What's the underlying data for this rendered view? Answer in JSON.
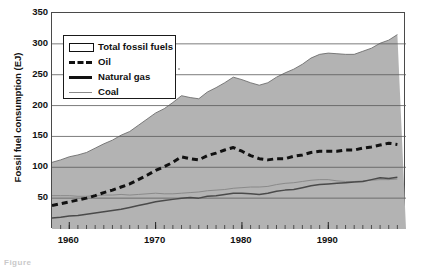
{
  "figure": {
    "caption_remnant": "Figure",
    "y_axis_title": "Fossil fuel consumption (EJ)"
  },
  "legend": {
    "items": [
      {
        "label": "Total fossil fuels",
        "key": "area-swatch-icon",
        "color": "#b3b3b3"
      },
      {
        "label": "Oil",
        "key": "dashed-line-icon",
        "color": "#111111"
      },
      {
        "label": "Natural gas",
        "key": "solid-thick-line-icon",
        "color": "#111111"
      },
      {
        "label": "Coal",
        "key": "thin-line-icon",
        "color": "#8a8a8a"
      }
    ]
  },
  "chart_data": {
    "type": "line",
    "title": "",
    "subtitle": "",
    "xlabel": "",
    "ylabel": "Fossil fuel consumption (EJ)",
    "xlim": [
      1958,
      1999
    ],
    "ylim": [
      0,
      350
    ],
    "yticks": [
      0,
      50,
      100,
      150,
      200,
      250,
      300,
      350
    ],
    "ytick_labels": [
      "",
      "50",
      "100",
      "150",
      "200",
      "250",
      "300",
      "350"
    ],
    "xticks": [
      1960,
      1970,
      1980,
      1990
    ],
    "xtick_labels": [
      "1960",
      "1970",
      "1980",
      "1990"
    ],
    "minor_xtick_interval": 1,
    "grid": "horizontal-only",
    "legend_position": "upper-left-inside",
    "x": [
      1958,
      1959,
      1960,
      1961,
      1962,
      1963,
      1964,
      1965,
      1966,
      1967,
      1968,
      1969,
      1970,
      1971,
      1972,
      1973,
      1974,
      1975,
      1976,
      1977,
      1978,
      1979,
      1980,
      1981,
      1982,
      1983,
      1984,
      1985,
      1986,
      1987,
      1988,
      1989,
      1990,
      1991,
      1992,
      1993,
      1994,
      1995,
      1996,
      1997,
      1998
    ],
    "series": [
      {
        "name": "Total fossil fuels",
        "style": "filled-area",
        "fill": "#b3b3b3",
        "values": [
          108,
          112,
          117,
          120,
          124,
          131,
          138,
          144,
          152,
          158,
          168,
          178,
          188,
          195,
          205,
          216,
          213,
          211,
          222,
          229,
          237,
          246,
          242,
          237,
          233,
          237,
          246,
          253,
          259,
          267,
          277,
          283,
          285,
          284,
          283,
          283,
          288,
          293,
          301,
          306,
          315
        ]
      },
      {
        "name": "Oil",
        "style": "dashed",
        "color": "#111111",
        "values": [
          38,
          41,
          44,
          47,
          50,
          54,
          59,
          63,
          68,
          73,
          80,
          87,
          95,
          101,
          108,
          117,
          114,
          112,
          119,
          123,
          128,
          132,
          126,
          119,
          114,
          112,
          114,
          114,
          118,
          120,
          124,
          126,
          126,
          126,
          128,
          128,
          131,
          133,
          136,
          139,
          137
        ]
      },
      {
        "name": "Natural gas",
        "style": "solid",
        "color": "#4a4a4a",
        "values": [
          18,
          19,
          21,
          22,
          24,
          26,
          28,
          30,
          32,
          35,
          38,
          41,
          44,
          46,
          48,
          50,
          51,
          50,
          53,
          54,
          56,
          58,
          58,
          57,
          56,
          58,
          61,
          63,
          64,
          67,
          70,
          72,
          73,
          74,
          75,
          76,
          77,
          80,
          83,
          82,
          84
        ]
      },
      {
        "name": "Coal",
        "style": "thin",
        "color": "#8a8a8a",
        "values": [
          54,
          54,
          54,
          53,
          53,
          54,
          55,
          55,
          56,
          55,
          56,
          57,
          58,
          57,
          57,
          58,
          59,
          60,
          62,
          63,
          64,
          66,
          67,
          68,
          68,
          69,
          72,
          74,
          75,
          77,
          79,
          80,
          80,
          78,
          77,
          77,
          78,
          79,
          80,
          80,
          81
        ]
      }
    ]
  }
}
